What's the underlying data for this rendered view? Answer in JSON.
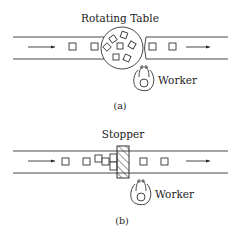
{
  "panel_a": {
    "title": "Rotating Table",
    "worker_label": "Worker",
    "caption": "(a)"
  },
  "panel_b": {
    "title": "Stopper",
    "worker_label": "Worker",
    "caption": "(b)"
  },
  "icons": {
    "flow_arrow": "right-arrow-icon",
    "worker": "worker-topview-icon",
    "part": "square-part-icon",
    "rotating_table": "circle-table-icon",
    "stopper": "hatched-stopper-icon"
  }
}
